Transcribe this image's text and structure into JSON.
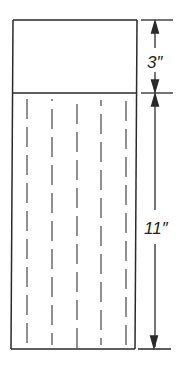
{
  "diagram": {
    "title": "",
    "top_section": {
      "height_label": "3″"
    },
    "bottom_section": {
      "height_label": "11″",
      "dashed_lines": 5
    },
    "colors": {
      "line": "#2a2a2a",
      "dash": "#555555",
      "background": "#ffffff"
    }
  }
}
